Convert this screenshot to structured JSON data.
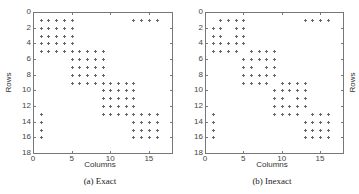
{
  "chart_data": [
    {
      "type": "scatter",
      "title": "",
      "caption": "(a) Exact",
      "xlabel": "Columns",
      "ylabel": "Rows",
      "xlim": [
        0,
        18
      ],
      "ylim": [
        18,
        0
      ],
      "xticks": [
        0,
        5,
        10,
        15
      ],
      "yticks": [
        0,
        2,
        4,
        6,
        8,
        10,
        12,
        14,
        16,
        18
      ],
      "grid": false,
      "marker": "+",
      "points": [
        [
          1,
          1
        ],
        [
          2,
          1
        ],
        [
          3,
          1
        ],
        [
          4,
          1
        ],
        [
          5,
          1
        ],
        [
          13,
          1
        ],
        [
          14,
          1
        ],
        [
          15,
          1
        ],
        [
          16,
          1
        ],
        [
          1,
          2
        ],
        [
          2,
          2
        ],
        [
          3,
          2
        ],
        [
          4,
          2
        ],
        [
          5,
          2
        ],
        [
          1,
          3
        ],
        [
          2,
          3
        ],
        [
          3,
          3
        ],
        [
          4,
          3
        ],
        [
          5,
          3
        ],
        [
          1,
          4
        ],
        [
          2,
          4
        ],
        [
          3,
          4
        ],
        [
          4,
          4
        ],
        [
          5,
          4
        ],
        [
          1,
          5
        ],
        [
          2,
          5
        ],
        [
          3,
          5
        ],
        [
          4,
          5
        ],
        [
          5,
          5
        ],
        [
          6,
          5
        ],
        [
          7,
          5
        ],
        [
          8,
          5
        ],
        [
          9,
          5
        ],
        [
          5,
          6
        ],
        [
          6,
          6
        ],
        [
          7,
          6
        ],
        [
          8,
          6
        ],
        [
          9,
          6
        ],
        [
          5,
          7
        ],
        [
          6,
          7
        ],
        [
          7,
          7
        ],
        [
          8,
          7
        ],
        [
          9,
          7
        ],
        [
          5,
          8
        ],
        [
          6,
          8
        ],
        [
          7,
          8
        ],
        [
          8,
          8
        ],
        [
          9,
          8
        ],
        [
          5,
          9
        ],
        [
          6,
          9
        ],
        [
          7,
          9
        ],
        [
          8,
          9
        ],
        [
          9,
          9
        ],
        [
          10,
          9
        ],
        [
          11,
          9
        ],
        [
          12,
          9
        ],
        [
          13,
          9
        ],
        [
          9,
          10
        ],
        [
          10,
          10
        ],
        [
          11,
          10
        ],
        [
          12,
          10
        ],
        [
          13,
          10
        ],
        [
          9,
          11
        ],
        [
          10,
          11
        ],
        [
          11,
          11
        ],
        [
          12,
          11
        ],
        [
          13,
          11
        ],
        [
          9,
          12
        ],
        [
          10,
          12
        ],
        [
          11,
          12
        ],
        [
          12,
          12
        ],
        [
          13,
          12
        ],
        [
          9,
          13
        ],
        [
          10,
          13
        ],
        [
          11,
          13
        ],
        [
          12,
          13
        ],
        [
          13,
          13
        ],
        [
          14,
          13
        ],
        [
          15,
          13
        ],
        [
          16,
          13
        ],
        [
          1,
          13
        ],
        [
          13,
          14
        ],
        [
          14,
          14
        ],
        [
          15,
          14
        ],
        [
          16,
          14
        ],
        [
          1,
          14
        ],
        [
          13,
          15
        ],
        [
          14,
          15
        ],
        [
          15,
          15
        ],
        [
          16,
          15
        ],
        [
          1,
          15
        ],
        [
          13,
          16
        ],
        [
          14,
          16
        ],
        [
          15,
          16
        ],
        [
          16,
          16
        ],
        [
          1,
          16
        ]
      ]
    },
    {
      "type": "scatter",
      "title": "",
      "caption": "(b) Inexact",
      "xlabel": "Columns",
      "ylabel": "Rows",
      "xlim": [
        0,
        18
      ],
      "ylim": [
        18,
        0
      ],
      "xticks": [
        0,
        5,
        10,
        15
      ],
      "yticks": [
        0,
        2,
        4,
        6,
        8,
        10,
        12,
        14,
        16,
        18
      ],
      "grid": false,
      "marker": "+",
      "points": [
        [
          2,
          1
        ],
        [
          3,
          1
        ],
        [
          4,
          1
        ],
        [
          5,
          1
        ],
        [
          13,
          1
        ],
        [
          14,
          1
        ],
        [
          15,
          1
        ],
        [
          16,
          1
        ],
        [
          1,
          2
        ],
        [
          2,
          2
        ],
        [
          4,
          2
        ],
        [
          5,
          2
        ],
        [
          1,
          3
        ],
        [
          2,
          3
        ],
        [
          4,
          3
        ],
        [
          5,
          3
        ],
        [
          1,
          4
        ],
        [
          2,
          4
        ],
        [
          3,
          4
        ],
        [
          4,
          4
        ],
        [
          5,
          4
        ],
        [
          1,
          5
        ],
        [
          2,
          5
        ],
        [
          3,
          5
        ],
        [
          4,
          5
        ],
        [
          6,
          5
        ],
        [
          7,
          5
        ],
        [
          8,
          5
        ],
        [
          9,
          5
        ],
        [
          5,
          6
        ],
        [
          6,
          6
        ],
        [
          7,
          6
        ],
        [
          8,
          6
        ],
        [
          9,
          6
        ],
        [
          5,
          7
        ],
        [
          6,
          7
        ],
        [
          8,
          7
        ],
        [
          9,
          7
        ],
        [
          5,
          8
        ],
        [
          6,
          8
        ],
        [
          7,
          8
        ],
        [
          8,
          8
        ],
        [
          9,
          8
        ],
        [
          5,
          9
        ],
        [
          6,
          9
        ],
        [
          7,
          9
        ],
        [
          8,
          9
        ],
        [
          10,
          9
        ],
        [
          11,
          9
        ],
        [
          12,
          9
        ],
        [
          13,
          9
        ],
        [
          9,
          10
        ],
        [
          10,
          10
        ],
        [
          11,
          10
        ],
        [
          12,
          10
        ],
        [
          13,
          10
        ],
        [
          9,
          11
        ],
        [
          10,
          11
        ],
        [
          12,
          11
        ],
        [
          13,
          11
        ],
        [
          9,
          12
        ],
        [
          10,
          12
        ],
        [
          11,
          12
        ],
        [
          12,
          12
        ],
        [
          13,
          12
        ],
        [
          9,
          13
        ],
        [
          10,
          13
        ],
        [
          11,
          13
        ],
        [
          12,
          13
        ],
        [
          14,
          13
        ],
        [
          15,
          13
        ],
        [
          16,
          13
        ],
        [
          1,
          13
        ],
        [
          13,
          14
        ],
        [
          14,
          14
        ],
        [
          15,
          14
        ],
        [
          16,
          14
        ],
        [
          1,
          14
        ],
        [
          13,
          15
        ],
        [
          14,
          15
        ],
        [
          15,
          15
        ],
        [
          16,
          15
        ],
        [
          1,
          15
        ],
        [
          13,
          16
        ],
        [
          14,
          16
        ],
        [
          15,
          16
        ],
        [
          16,
          16
        ],
        [
          1,
          16
        ]
      ]
    }
  ],
  "panels": [
    {
      "caption": "(a) Exact",
      "xlabel": "Columns",
      "ylabel": "Rows"
    },
    {
      "caption": "(b) Inexact",
      "xlabel": "Columns",
      "ylabel": "Rows"
    }
  ]
}
